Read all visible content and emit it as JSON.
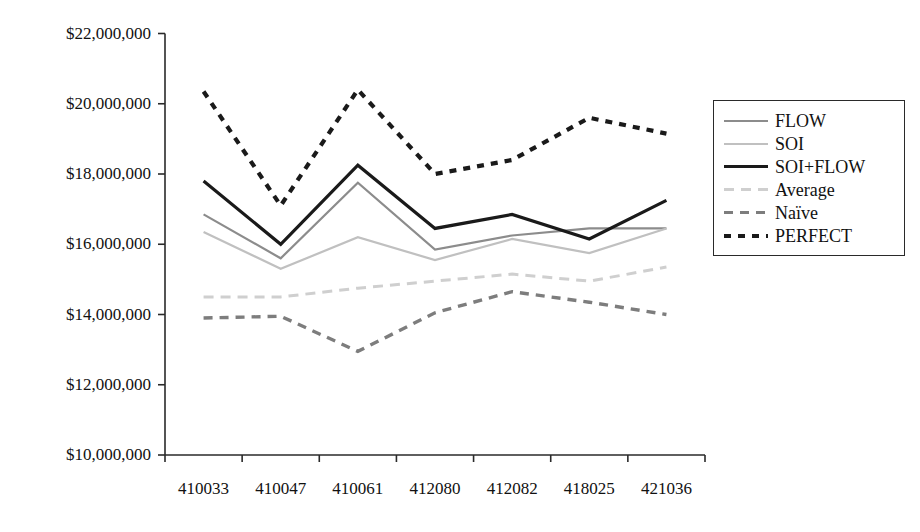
{
  "chart_data": {
    "type": "line",
    "title": "",
    "xlabel": "",
    "ylabel": "",
    "categories": [
      "410033",
      "410047",
      "410061",
      "412080",
      "412082",
      "418025",
      "421036"
    ],
    "ylim": [
      10000000,
      22000000
    ],
    "ytick_values": [
      10000000,
      12000000,
      14000000,
      16000000,
      18000000,
      20000000,
      22000000
    ],
    "ytick_labels": [
      "$10,000,000",
      "$12,000,000",
      "$14,000,000",
      "$16,000,000",
      "$18,000,000",
      "$20,000,000",
      "$22,000,000"
    ],
    "grid": false,
    "legend_position": "right-top",
    "series": [
      {
        "name": "FLOW",
        "color": "#8c8c8c",
        "width": 2.2,
        "dash": "none",
        "values": [
          16850000,
          15600000,
          17750000,
          15850000,
          16250000,
          16450000,
          16450000
        ]
      },
      {
        "name": "SOI",
        "color": "#c0c0c0",
        "width": 2.2,
        "dash": "none",
        "values": [
          16350000,
          15300000,
          16200000,
          15550000,
          16150000,
          15750000,
          16450000
        ]
      },
      {
        "name": "SOI+FLOW",
        "color": "#1a1a1a",
        "width": 3.2,
        "dash": "none",
        "values": [
          17800000,
          16000000,
          18250000,
          16450000,
          16850000,
          16150000,
          17250000
        ]
      },
      {
        "name": "Average",
        "color": "#cfcfcf",
        "width": 3.0,
        "dash": "10,7",
        "values": [
          14500000,
          14500000,
          14750000,
          14950000,
          15150000,
          14950000,
          15350000
        ]
      },
      {
        "name": "Naïve",
        "color": "#7d7d7d",
        "width": 3.4,
        "dash": "9,7",
        "values": [
          13900000,
          13950000,
          12950000,
          14050000,
          14650000,
          14350000,
          14000000
        ]
      },
      {
        "name": "PERFECT",
        "color": "#1a1a1a",
        "width": 4.2,
        "dash": "7,7",
        "values": [
          20350000,
          17100000,
          20400000,
          18000000,
          18400000,
          19600000,
          19150000
        ]
      }
    ]
  },
  "legend": {
    "items": [
      {
        "label": "FLOW"
      },
      {
        "label": "SOI"
      },
      {
        "label": "SOI+FLOW"
      },
      {
        "label": "Average"
      },
      {
        "label": "Naïve"
      },
      {
        "label": "PERFECT"
      }
    ]
  },
  "axis": {
    "line_color": "#2a2a2a"
  }
}
